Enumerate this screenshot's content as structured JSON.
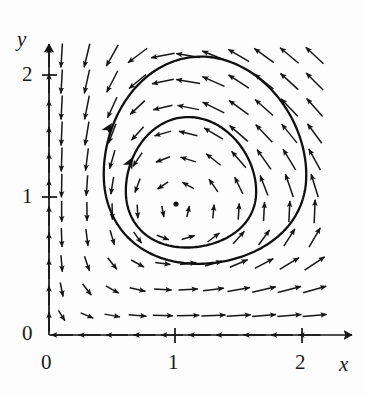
{
  "figure": {
    "kind": "phase-portrait",
    "background_color": "#fdfdfd",
    "ink_color": "#1a1a1a"
  },
  "axes": {
    "x_axis_label": "x",
    "y_axis_label": "y",
    "x_ticks": [
      "0",
      "1",
      "2"
    ],
    "y_ticks": [
      "0",
      "1",
      "2"
    ],
    "x_tick_values": [
      0,
      1,
      2
    ],
    "y_tick_values": [
      0,
      1,
      2
    ],
    "x_range": [
      0,
      2.45
    ],
    "y_range": [
      0,
      2.35
    ],
    "arrowheads": true,
    "grid": false
  },
  "chart_data": {
    "type": "scatter",
    "title": "",
    "xlabel": "x",
    "ylabel": "y",
    "xlim": [
      0,
      2.45
    ],
    "ylim": [
      0,
      2.35
    ],
    "grid": false,
    "legend": "none",
    "equilibrium": {
      "label": "center",
      "x": 1.0,
      "y": 0.97,
      "marker": "dot"
    },
    "flow_direction": "clockwise",
    "vector_field": {
      "description": "arrow grid, unit-ish glyphs, spacing 0.2 in data units",
      "x_start": 0.1,
      "y_start": 0.15,
      "spacing": 0.2,
      "nx": 11,
      "ny": 11,
      "model": {
        "dx": "x*(a - b*y)",
        "dy": "y*(c*x - d)",
        "a": 1.0,
        "b": 1.0,
        "c": 1.0,
        "d": 1.0
      },
      "notes": "Lotka-Volterra type: arrows point up near x small, right along top, down on right, left along bottom"
    },
    "orbits": [
      {
        "name": "outer-orbit",
        "closed": true,
        "direction": "clockwise",
        "x_min": 0.44,
        "x_max": 2.03,
        "y_min": 0.4,
        "y_max": 2.06,
        "arrow_markers": 1
      },
      {
        "name": "inner-orbit",
        "closed": true,
        "direction": "clockwise",
        "x_min": 0.61,
        "x_max": 0.64,
        "x_right": 1.64,
        "y_min": 0.58,
        "y_max": 1.64,
        "arrow_markers": 1
      }
    ]
  }
}
